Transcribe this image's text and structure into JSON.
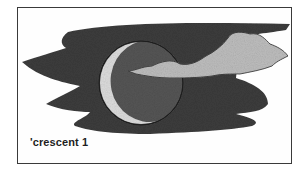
{
  "illustration": {
    "subject": "crescent moon against a dark night sky with a drifting cloud",
    "colors": {
      "sky": "#3c3c3c",
      "moon_dark": "#555555",
      "crescent": "#dcdcdc",
      "cloud": "#bdbdbd",
      "frame": "#3a3a3a",
      "background": "#ffffff"
    }
  },
  "caption": {
    "text": "'crescent 1"
  }
}
